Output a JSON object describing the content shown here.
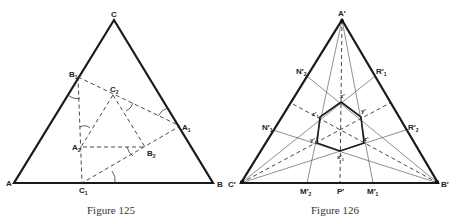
{
  "figure125": {
    "caption": "Figure 125",
    "labels": {
      "A": "A",
      "B": "B",
      "C": "C",
      "A1": "A",
      "A1_sub": "1",
      "B1": "B",
      "B1_sub": "1",
      "C1": "C",
      "C1_sub": "1",
      "A2": "A",
      "A2_sub": "2",
      "B2": "B",
      "B2_sub": "2",
      "C2": "C",
      "C2_sub": "2"
    }
  },
  "figure126": {
    "caption": "Figure 126",
    "labels": {
      "A": "A′",
      "B": "B′",
      "C": "C′",
      "P": "P′",
      "M1": "M′",
      "M1_sub": "1",
      "M2": "M′",
      "M2_sub": "2",
      "N1": "N′",
      "N1_sub": "1",
      "N2": "N′",
      "N2_sub": "2",
      "R1": "R′",
      "R1_sub": "1",
      "R2": "R′",
      "R2_sub": "2",
      "x": "x′",
      "y": "y′",
      "z": "z′",
      "x1": "x′",
      "x1_sub": "1",
      "y1": "y′",
      "y1_sub": "1",
      "z1": "z′",
      "z1_sub": "1"
    }
  }
}
